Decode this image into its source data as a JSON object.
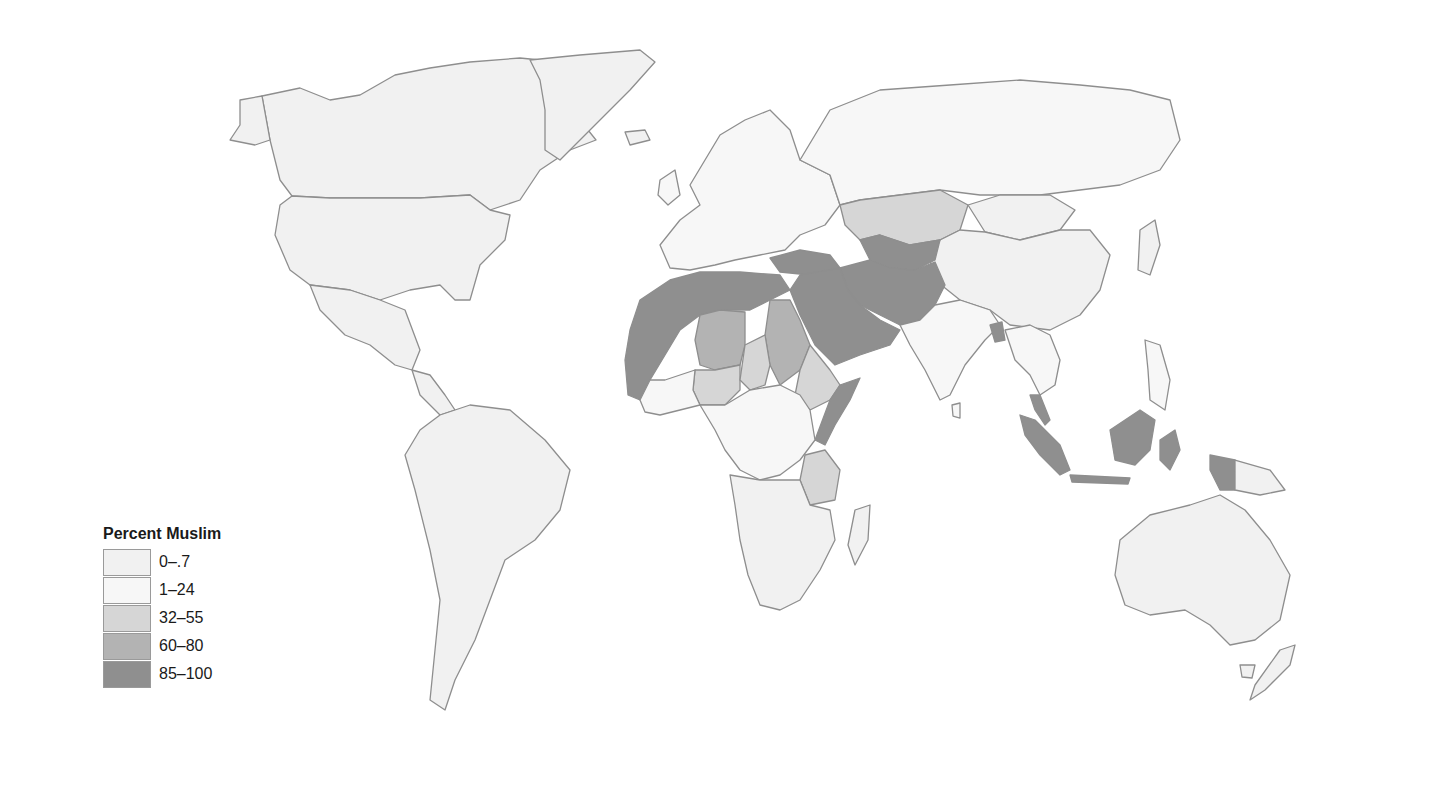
{
  "map": {
    "type": "choropleth",
    "subject": "World map, percent Muslim population by country",
    "colors": {
      "c0": "#f1f1f1",
      "c1": "#f7f7f7",
      "c2": "#d6d6d6",
      "c3": "#b3b3b3",
      "c4": "#8f8f8f",
      "border": "#8e8e8e",
      "water": "#ffffff"
    }
  },
  "legend": {
    "title": "Percent Muslim",
    "items": [
      {
        "label": "0–.7",
        "color": "#f1f1f1"
      },
      {
        "label": "1–24",
        "color": "#f7f7f7"
      },
      {
        "label": "32–55",
        "color": "#d6d6d6"
      },
      {
        "label": "60–80",
        "color": "#b3b3b3"
      },
      {
        "label": "85–100",
        "color": "#8f8f8f"
      }
    ]
  },
  "regions": {
    "85-100": [
      "Morocco",
      "Algeria",
      "Tunisia",
      "Libya",
      "Egypt",
      "Mauritania",
      "Mali",
      "Senegal",
      "Gambia",
      "Guinea",
      "Niger",
      "Somalia",
      "Djibouti",
      "Saudi Arabia",
      "Yemen",
      "Oman",
      "UAE",
      "Qatar",
      "Kuwait",
      "Iraq",
      "Syria",
      "Jordan",
      "Turkey",
      "Iran",
      "Afghanistan",
      "Pakistan",
      "Azerbaijan",
      "Turkmenistan",
      "Uzbekistan",
      "Tajikistan",
      "Kyrgyzstan",
      "Bangladesh",
      "Indonesia",
      "Malaysia",
      "Brunei"
    ],
    "60-80": [
      "Chad",
      "Sudan",
      "Burkina Faso",
      "Sierra Leone"
    ],
    "32-55": [
      "Kazakhstan",
      "Nigeria",
      "Ethiopia",
      "Eritrea",
      "Tanzania",
      "Guinea-Bissau",
      "Ivory Coast",
      "Lebanon"
    ],
    "1-24": [
      "India",
      "Russia",
      "Mozambique",
      "Ghana",
      "Cameroon",
      "Central African Republic",
      "Kenya",
      "Uganda",
      "Malawi",
      "Thailand",
      "Philippines",
      "Israel",
      "Europe"
    ],
    "0-.7": [
      "Americas",
      "Greenland",
      "China",
      "Mongolia",
      "Japan",
      "Australia",
      "New Zealand",
      "Southern Africa"
    ]
  }
}
